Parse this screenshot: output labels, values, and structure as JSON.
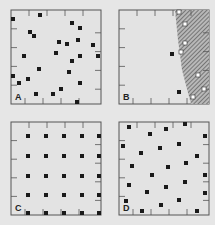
{
  "colors": {
    "background": "#e6e6e6",
    "panel": "#e3e3e3",
    "border": "#555555",
    "marker": "#1a1a1a",
    "hatch": "#555555",
    "hatch_bg": "#b8b8b8"
  },
  "panels": [
    {
      "id": "A",
      "label": "A",
      "x": 11,
      "y": 10,
      "w": 90,
      "h": 94,
      "points": [
        [
          13,
          19
        ],
        [
          40,
          15
        ],
        [
          30,
          32
        ],
        [
          34,
          36
        ],
        [
          72,
          23
        ],
        [
          80,
          28
        ],
        [
          78,
          40
        ],
        [
          59,
          42
        ],
        [
          67,
          44
        ],
        [
          93,
          45
        ],
        [
          56,
          53
        ],
        [
          24,
          56
        ],
        [
          98,
          56
        ],
        [
          80,
          56
        ],
        [
          72,
          61
        ],
        [
          39,
          69
        ],
        [
          69,
          72
        ],
        [
          13,
          76
        ],
        [
          28,
          79
        ],
        [
          19,
          83
        ],
        [
          80,
          83
        ],
        [
          61,
          89
        ],
        [
          36,
          94
        ],
        [
          53,
          94
        ],
        [
          77,
          102
        ]
      ]
    },
    {
      "id": "B",
      "label": "B",
      "x": 119,
      "y": 10,
      "w": 90,
      "h": 94,
      "points": [
        [
          172,
          54
        ],
        [
          179,
          92
        ]
      ],
      "open_points": [
        [
          179,
          12
        ],
        [
          185,
          24
        ],
        [
          185,
          43
        ],
        [
          181,
          52
        ],
        [
          198,
          75
        ],
        [
          204,
          89
        ],
        [
          193,
          97
        ]
      ],
      "hatched_region": "175,10 209,10 209,104 191,104 182,70 178,40"
    },
    {
      "id": "C",
      "label": "C",
      "x": 11,
      "y": 122,
      "w": 90,
      "h": 93,
      "points": [
        [
          28,
          136
        ],
        [
          46,
          136
        ],
        [
          64,
          136
        ],
        [
          82,
          136
        ],
        [
          99,
          136
        ],
        [
          28,
          156
        ],
        [
          46,
          156
        ],
        [
          64,
          156
        ],
        [
          82,
          156
        ],
        [
          99,
          156
        ],
        [
          28,
          176
        ],
        [
          46,
          176
        ],
        [
          64,
          176
        ],
        [
          82,
          176
        ],
        [
          99,
          176
        ],
        [
          28,
          195
        ],
        [
          46,
          195
        ],
        [
          64,
          195
        ],
        [
          82,
          195
        ],
        [
          99,
          195
        ],
        [
          28,
          213
        ],
        [
          46,
          213
        ],
        [
          64,
          213
        ],
        [
          82,
          213
        ],
        [
          99,
          213
        ]
      ]
    },
    {
      "id": "D",
      "label": "D",
      "x": 119,
      "y": 122,
      "w": 90,
      "h": 93,
      "points": [
        [
          129,
          127
        ],
        [
          150,
          134
        ],
        [
          166,
          129
        ],
        [
          185,
          124
        ],
        [
          205,
          136
        ],
        [
          123,
          146
        ],
        [
          141,
          153
        ],
        [
          160,
          148
        ],
        [
          179,
          144
        ],
        [
          197,
          156
        ],
        [
          132,
          166
        ],
        [
          168,
          167
        ],
        [
          186,
          163
        ],
        [
          205,
          175
        ],
        [
          152,
          175
        ],
        [
          129,
          185
        ],
        [
          166,
          187
        ],
        [
          185,
          182
        ],
        [
          147,
          192
        ],
        [
          205,
          193
        ],
        [
          126,
          201
        ],
        [
          161,
          205
        ],
        [
          179,
          200
        ],
        [
          142,
          211
        ],
        [
          197,
          211
        ]
      ]
    }
  ]
}
